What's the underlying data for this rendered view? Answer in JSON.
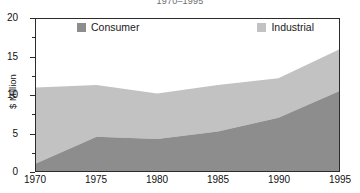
{
  "title": "1970–1995",
  "legend": {
    "position": "top-inside",
    "items": [
      {
        "label": "Consumer",
        "color": "#8d8d8d",
        "name": "consumer"
      },
      {
        "label": "Industrial",
        "color": "#c2c2c2",
        "name": "industrial"
      }
    ]
  },
  "axes": {
    "y": {
      "label": "$ Million",
      "ticks": [
        "0",
        "5",
        "10",
        "15",
        "20"
      ],
      "minor_ticks": [
        "2.5",
        "7.5",
        "12.5",
        "17.5"
      ],
      "min": 0,
      "max": 20
    },
    "x": {
      "label": "",
      "ticks": [
        "1970",
        "1975",
        "1980",
        "1985",
        "1990",
        "1995"
      ],
      "min": 1970,
      "max": 1995
    }
  },
  "colors": {
    "consumer": "#8d8d8d",
    "industrial": "#c2c2c2",
    "axis": "#2b2b2b",
    "background": "#ffffff",
    "title": "#6e6e6e"
  },
  "chart_data": {
    "type": "area",
    "stacked": true,
    "title": "1970–1995",
    "xlabel": "",
    "ylabel": "$ Million",
    "xlim": [
      1970,
      1995
    ],
    "ylim": [
      0,
      20
    ],
    "grid": false,
    "legend_position": "top-inside",
    "x": [
      1970,
      1975,
      1980,
      1985,
      1990,
      1995
    ],
    "categories": [
      "1970",
      "1975",
      "1980",
      "1985",
      "1990",
      "1995"
    ],
    "series": [
      {
        "name": "Consumer",
        "color": "#8d8d8d",
        "values": [
          1.0,
          4.5,
          4.2,
          5.2,
          7.0,
          10.5
        ]
      },
      {
        "name": "Industrial",
        "color": "#c2c2c2",
        "values": [
          10.0,
          6.8,
          6.0,
          6.1,
          5.2,
          5.5
        ]
      }
    ],
    "cumulative_totals": [
      11.0,
      11.3,
      10.2,
      11.3,
      12.2,
      16.0
    ]
  }
}
